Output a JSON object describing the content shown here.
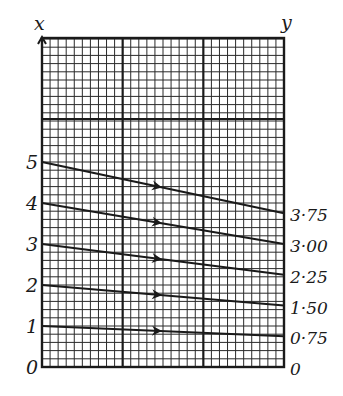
{
  "diagram": {
    "left_axis_label": "x",
    "right_axis_label": "y",
    "left_ticks": [
      {
        "label": "0",
        "value": 0
      },
      {
        "label": "1",
        "value": 1
      },
      {
        "label": "2",
        "value": 2
      },
      {
        "label": "3",
        "value": 3
      },
      {
        "label": "4",
        "value": 4
      },
      {
        "label": "5",
        "value": 5
      }
    ],
    "right_ticks": [
      {
        "label": "0",
        "value": 0
      },
      {
        "label": "0·75",
        "value": 0.75
      },
      {
        "label": "1·50",
        "value": 1.5
      },
      {
        "label": "2·25",
        "value": 2.25
      },
      {
        "label": "3·00",
        "value": 3.0
      },
      {
        "label": "3·75",
        "value": 3.75
      }
    ],
    "mappings": [
      {
        "from": 1,
        "to": 0.75
      },
      {
        "from": 2,
        "to": 1.5
      },
      {
        "from": 3,
        "to": 2.25
      },
      {
        "from": 4,
        "to": 3.0
      },
      {
        "from": 5,
        "to": 3.75
      }
    ],
    "colors": {
      "ink": "#1a1a1a",
      "grid": "#2a2a2a",
      "background": "#ffffff"
    }
  }
}
